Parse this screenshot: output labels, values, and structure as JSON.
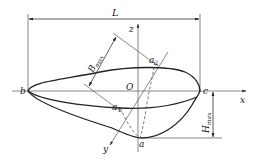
{
  "diagram": {
    "type": "geometric-dimension-diagram",
    "colors": {
      "stroke": "#222222",
      "thin": "#555555",
      "background": "#ffffff"
    },
    "labels": {
      "length": "L",
      "z_axis": "z",
      "x_axis": "x",
      "y_axis": "y",
      "origin": "O",
      "point_b": "b",
      "point_c": "c",
      "point_a": "a",
      "point_a1": "a",
      "point_a1_sub": "1",
      "point_a2": "a",
      "point_a2_sub": "2",
      "width_max": "B",
      "width_max_sub": "max",
      "height_max": "H",
      "height_max_sub": "max"
    }
  }
}
